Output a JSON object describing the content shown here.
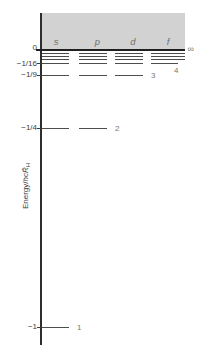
{
  "figure_title": "Hydrogen atom energy-level diagram",
  "axis_title": {
    "prefix": "Energy/",
    "italic_part": "hcR̃",
    "subscript": "H"
  },
  "colors": {
    "continuum_band": "#d2d2d2",
    "axis": "#2e2e2e",
    "continuum_edge_line": "#1f1f1f",
    "level_line": "#4d4d4d",
    "tick_text": "#3c3c3c",
    "muted_label": "#777777"
  },
  "chart_data": {
    "type": "energy-level-diagram",
    "ylabel": "Energy/hcR̃_H",
    "orbital_columns": [
      "s",
      "p",
      "d",
      "f"
    ],
    "tick_labels": [
      "0",
      "−1/16",
      "−1/9",
      "−1/4",
      "−1"
    ],
    "continuum": {
      "label": "∞",
      "energy": "0",
      "shaded": true
    },
    "levels": [
      {
        "kind": "continuum-edge",
        "tick_label": "0",
        "n_label": "∞",
        "energy": "0",
        "columns": [
          "s",
          "p",
          "d",
          "f"
        ],
        "y": 50
      },
      {
        "kind": "convergence",
        "n_label": "",
        "columns": [
          "s",
          "p",
          "d",
          "f"
        ],
        "y": 53.5
      },
      {
        "kind": "convergence",
        "n_label": "",
        "columns": [
          "s",
          "p",
          "d",
          "f"
        ],
        "y": 56.5
      },
      {
        "kind": "convergence",
        "n_label": "",
        "columns": [
          "s",
          "p",
          "d",
          "f"
        ],
        "y": 59.5
      },
      {
        "kind": "level",
        "tick_label": "−1/16",
        "n_label": "4",
        "energy": "−1/16",
        "columns": [
          "s",
          "p",
          "d",
          "f"
        ],
        "y": 63.5,
        "n_label_pos": "below-right"
      },
      {
        "kind": "level",
        "tick_label": "−1/9",
        "n_label": "3",
        "energy": "−1/9",
        "columns": [
          "s",
          "p",
          "d"
        ],
        "y": 75,
        "n_label_pos": "right"
      },
      {
        "kind": "level",
        "tick_label": "−1/4",
        "n_label": "2",
        "energy": "−1/4",
        "columns": [
          "s",
          "p"
        ],
        "y": 128,
        "n_label_pos": "right"
      },
      {
        "kind": "level",
        "tick_label": "−1",
        "n_label": "1",
        "energy": "−1",
        "columns": [
          "s"
        ],
        "y": 327,
        "n_label_pos": "right"
      }
    ]
  }
}
